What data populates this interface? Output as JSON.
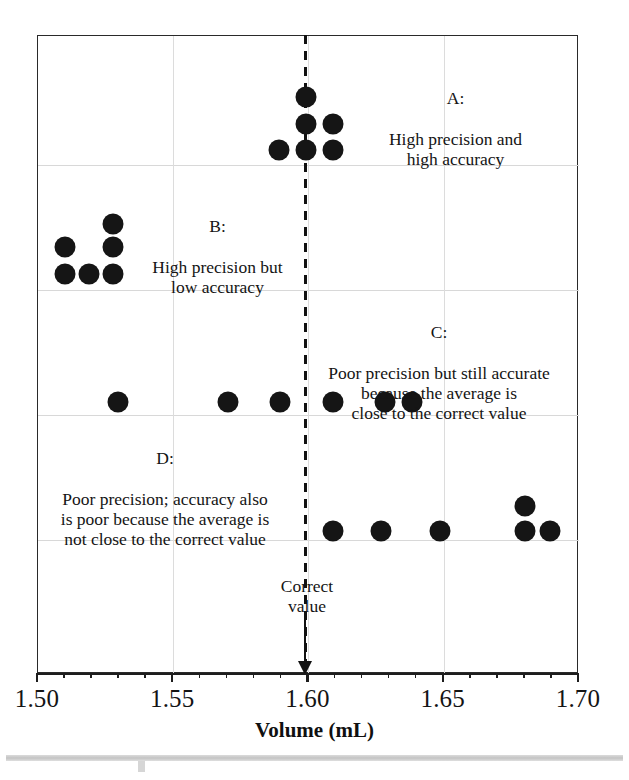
{
  "figure": {
    "x_axis_title": "Volume (mL)",
    "correct_value_caption": "Correct\nvalue"
  },
  "axis": {
    "tick_labels": [
      "1.50",
      "1.55",
      "1.60",
      "1.65",
      "1.70"
    ],
    "tick_values": [
      1.5,
      1.55,
      1.6,
      1.65,
      1.7
    ],
    "min": 1.5,
    "max": 1.7,
    "minor_tick_step": 0.01
  },
  "annotations": [
    {
      "key": "A:",
      "text": "High precision and\nhigh accuracy",
      "full": "A:\nHigh precision and\nhigh accuracy"
    },
    {
      "key": "B:",
      "text": "High precision but\nlow accuracy",
      "full": "B:\nHigh precision but\nlow accuracy"
    },
    {
      "key": "C:",
      "text": "Poor precision but still accurate\nbecause the average is\nclose to the correct value",
      "full": "C:\nPoor precision but still accurate\nbecause the average is\nclose to the correct value"
    },
    {
      "key": "D:",
      "text": "Poor precision; accuracy also\nis poor because the average is\nnot close to the correct value",
      "full": "D:\nPoor precision; accuracy also\nis poor because the average is\nnot close to the correct value"
    }
  ],
  "colors": {
    "dot": "#151515",
    "frame": "#2a2a2a",
    "grid": "#d8d8d8",
    "axis": "#1d1d1d",
    "text": "#141414",
    "background": "#ffffff"
  },
  "chart_data": {
    "type": "scatter",
    "title": "",
    "subtitle": "",
    "xlabel": "Volume (mL)",
    "ylabel": "",
    "xlim": [
      1.5,
      1.7
    ],
    "grid": true,
    "legend": "none",
    "reference_line": {
      "label": "Correct value",
      "x": 1.6,
      "style": "dashed",
      "arrow": true
    },
    "series": [
      {
        "name": "A: High precision and high accuracy",
        "x": [
          1.6,
          1.6,
          1.61,
          1.59,
          1.6,
          1.61
        ],
        "stack_rows": [
          3,
          2,
          1
        ],
        "mean": 1.601,
        "precision": "high",
        "accuracy": "high"
      },
      {
        "name": "B: High precision but low accuracy",
        "x": [
          1.53,
          1.51,
          1.53,
          1.51,
          1.52,
          1.53
        ],
        "stack_rows": [
          3,
          2,
          1
        ],
        "mean": 1.522,
        "precision": "high",
        "accuracy": "low"
      },
      {
        "name": "C: Poor precision but still accurate",
        "x": [
          1.53,
          1.57,
          1.59,
          1.61,
          1.63,
          1.64
        ],
        "stack_rows": [
          1,
          1,
          1,
          1,
          1,
          1
        ],
        "mean": 1.595,
        "precision": "low",
        "accuracy": "high"
      },
      {
        "name": "D: Poor precision; accuracy also is poor",
        "x": [
          1.61,
          1.625,
          1.65,
          1.68,
          1.68,
          1.69
        ],
        "stack_rows": [
          1,
          1,
          1,
          2,
          1
        ],
        "mean": 1.656,
        "precision": "low",
        "accuracy": "low"
      }
    ],
    "points": [
      {
        "group": "A",
        "x": 1.6,
        "px": 306,
        "py": 97
      },
      {
        "group": "A",
        "x": 1.6,
        "px": 306,
        "py": 124
      },
      {
        "group": "A",
        "x": 1.61,
        "px": 333,
        "py": 124
      },
      {
        "group": "A",
        "x": 1.59,
        "px": 279,
        "py": 150
      },
      {
        "group": "A",
        "x": 1.6,
        "px": 306,
        "py": 150
      },
      {
        "group": "A",
        "x": 1.61,
        "px": 333,
        "py": 150
      },
      {
        "group": "B",
        "x": 1.53,
        "px": 113,
        "py": 224
      },
      {
        "group": "B",
        "x": 1.51,
        "px": 65,
        "py": 247
      },
      {
        "group": "B",
        "x": 1.53,
        "px": 113,
        "py": 247
      },
      {
        "group": "B",
        "x": 1.51,
        "px": 65,
        "py": 274
      },
      {
        "group": "B",
        "x": 1.52,
        "px": 89,
        "py": 274
      },
      {
        "group": "B",
        "x": 1.53,
        "px": 113,
        "py": 274
      },
      {
        "group": "C",
        "x": 1.53,
        "px": 118,
        "py": 402
      },
      {
        "group": "C",
        "x": 1.57,
        "px": 228,
        "py": 402
      },
      {
        "group": "C",
        "x": 1.59,
        "px": 280,
        "py": 402
      },
      {
        "group": "C",
        "x": 1.61,
        "px": 333,
        "py": 402
      },
      {
        "group": "C",
        "x": 1.63,
        "px": 385,
        "py": 402
      },
      {
        "group": "C",
        "x": 1.64,
        "px": 412,
        "py": 402
      },
      {
        "group": "D",
        "x": 1.68,
        "px": 525,
        "py": 506
      },
      {
        "group": "D",
        "x": 1.61,
        "px": 333,
        "py": 531
      },
      {
        "group": "D",
        "x": 1.625,
        "px": 381,
        "py": 531
      },
      {
        "group": "D",
        "x": 1.65,
        "px": 440,
        "py": 531
      },
      {
        "group": "D",
        "x": 1.68,
        "px": 525,
        "py": 531
      },
      {
        "group": "D",
        "x": 1.69,
        "px": 550,
        "py": 531
      }
    ]
  }
}
